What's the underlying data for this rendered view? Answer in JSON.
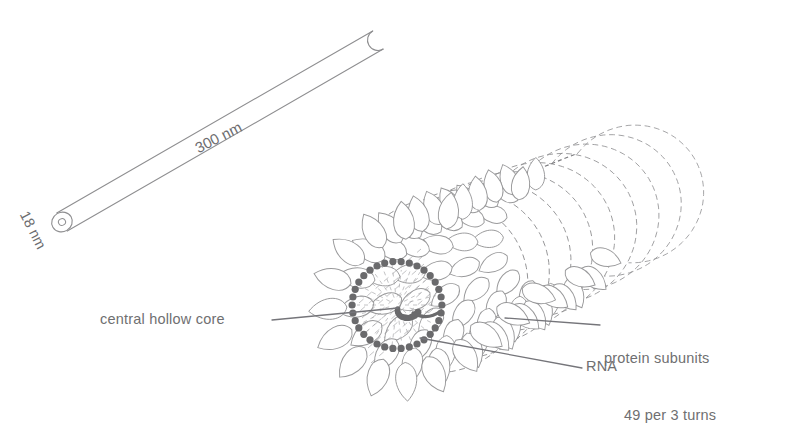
{
  "figure": {
    "background_color": "#ffffff",
    "ink_color": "#8e8e90",
    "text_color": "#6f6f71",
    "rna_color": "#6a6a6c",
    "leader_color": "#75757a"
  },
  "rod": {
    "length_label": "300 nm",
    "diameter_label": "18 nm",
    "description": "whole virus rod drawn as a capsule with open hollow end"
  },
  "labels": {
    "central_hollow_core": "central hollow core",
    "rna": "RNA",
    "protein_subunits_line1": "protein subunits",
    "protein_subunits_line2": "49 per 3 turns"
  },
  "chart_data": {
    "type": "diagram",
    "annotations": [
      "300 nm",
      "18 nm",
      "central hollow core",
      "RNA",
      "protein subunits",
      "49 per 3 turns"
    ],
    "structure": {
      "rod_length_nm": 300,
      "rod_diameter_nm": 18,
      "subunits_per_3_turns": 49,
      "helix_turns_drawn": 9
    }
  }
}
